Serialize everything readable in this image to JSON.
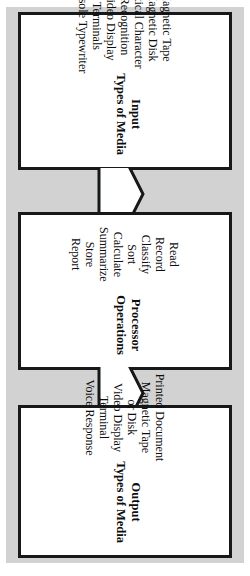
{
  "diagram": {
    "orientation": "rotated-90-clockwise",
    "background_color": "#d2d2d2",
    "box_fill_color": "#ffffff",
    "line_color": "#17181a",
    "stages": [
      {
        "id": "input",
        "title": "Input",
        "subtitle": "Types of Media",
        "items": [
          "Magnetic Tape",
          "Magnetic Disk",
          "Optical Character",
          "Recognition",
          "Video Display",
          "Terminals",
          "Console Typewriter"
        ]
      },
      {
        "id": "processor",
        "title": "Processor",
        "subtitle": "Operations",
        "items": [
          "Read",
          "Record",
          "Classify",
          "Sort",
          "Calculate",
          "Summarize",
          "Store",
          "Report"
        ]
      },
      {
        "id": "output",
        "title": "Output",
        "subtitle": "Types of Media",
        "items": [
          "Printed Document",
          "Magnetic Tape",
          "or Disk",
          "Video Display",
          "Terminal",
          "Voice Response"
        ]
      }
    ],
    "connectors": [
      {
        "id": "input-to-processor",
        "icon": "down-arrow-icon",
        "from": "input",
        "to": "processor"
      },
      {
        "id": "processor-to-output",
        "icon": "down-arrow-icon",
        "from": "processor",
        "to": "output"
      }
    ]
  }
}
